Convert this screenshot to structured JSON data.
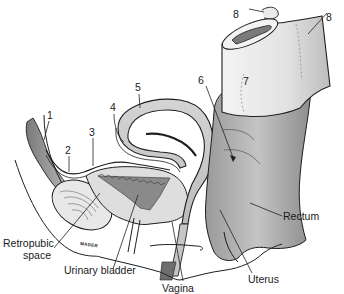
{
  "figure": {
    "signature": "MADER"
  },
  "numbered_labels": [
    {
      "id": "1",
      "text": "1"
    },
    {
      "id": "2",
      "text": "2"
    },
    {
      "id": "3",
      "text": "3"
    },
    {
      "id": "4",
      "text": "4"
    },
    {
      "id": "5",
      "text": "5"
    },
    {
      "id": "6",
      "text": "6"
    },
    {
      "id": "7",
      "text": "7"
    },
    {
      "id": "8a",
      "text": "8"
    },
    {
      "id": "8b",
      "text": "8"
    }
  ],
  "named_labels": {
    "retropubic_line1": "Retropubic",
    "retropubic_line2": "space",
    "urinary_bladder": "Urinary bladder",
    "vagina": "Vagina",
    "uterus": "Uterus",
    "rectum": "Rectum"
  },
  "colors": {
    "outline": "#1e1e1e",
    "tissue_light": "#e6e6e6",
    "tissue_mid": "#c8c8c8",
    "tissue_dark": "#8c8c8c",
    "cavity_dark": "#6e6e6e",
    "background": "#ffffff"
  }
}
